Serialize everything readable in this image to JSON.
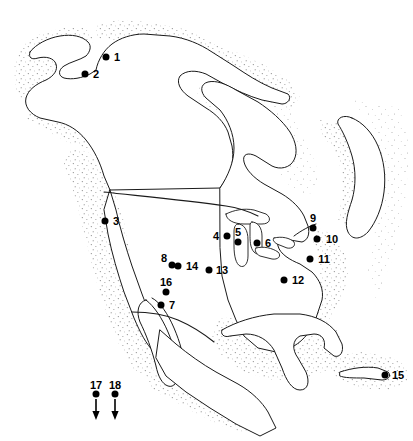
{
  "figure": {
    "kind": "locator-map",
    "region": "North America",
    "background_color": "#ffffff",
    "ink_color": "#000000",
    "coastline_shading": "stipple"
  },
  "markers": [
    {
      "id": "1",
      "label": "1",
      "x": 106,
      "y": 57,
      "label_x": 117,
      "label_y": 57
    },
    {
      "id": "2",
      "label": "2",
      "x": 85,
      "y": 74,
      "label_x": 96,
      "label_y": 74
    },
    {
      "id": "3",
      "label": "3",
      "x": 105,
      "y": 221,
      "label_x": 116,
      "label_y": 221
    },
    {
      "id": "4",
      "label": "4",
      "x": 227,
      "y": 236,
      "label_x": 216,
      "label_y": 236
    },
    {
      "id": "5",
      "label": "5",
      "x": 238,
      "y": 242,
      "label_x": 238,
      "label_y": 232
    },
    {
      "id": "6",
      "label": "6",
      "x": 257,
      "y": 243,
      "label_x": 268,
      "label_y": 243
    },
    {
      "id": "7",
      "label": "7",
      "x": 161,
      "y": 305,
      "label_x": 172,
      "label_y": 305
    },
    {
      "id": "8",
      "label": "8",
      "x": 172,
      "y": 265,
      "label_x": 164,
      "label_y": 258
    },
    {
      "id": "9",
      "label": "9",
      "x": 313,
      "y": 228,
      "label_x": 313,
      "label_y": 218
    },
    {
      "id": "10",
      "label": "10",
      "x": 317,
      "y": 239,
      "label_x": 332,
      "label_y": 239
    },
    {
      "id": "11",
      "label": "11",
      "x": 310,
      "y": 259,
      "label_x": 324,
      "label_y": 259
    },
    {
      "id": "12",
      "label": "12",
      "x": 284,
      "y": 280,
      "label_x": 298,
      "label_y": 280
    },
    {
      "id": "13",
      "label": "13",
      "x": 209,
      "y": 270,
      "label_x": 222,
      "label_y": 270
    },
    {
      "id": "14",
      "label": "14",
      "x": 178,
      "y": 266,
      "label_x": 192,
      "label_y": 266
    },
    {
      "id": "15",
      "label": "15",
      "x": 385,
      "y": 375,
      "label_x": 398,
      "label_y": 375
    },
    {
      "id": "16",
      "label": "16",
      "x": 166,
      "y": 292,
      "label_x": 166,
      "label_y": 282
    },
    {
      "id": "17",
      "label": "17",
      "x": 96,
      "y": 394,
      "label_x": 96,
      "label_y": 385
    },
    {
      "id": "18",
      "label": "18",
      "x": 115,
      "y": 394,
      "label_x": 115,
      "label_y": 385
    }
  ],
  "arrows": [
    {
      "id": "arrow-17",
      "for_marker": "17",
      "x": 96,
      "y_start": 399,
      "y_end": 419,
      "direction": "down"
    },
    {
      "id": "arrow-18",
      "for_marker": "18",
      "x": 115,
      "y_start": 399,
      "y_end": 419,
      "direction": "down"
    }
  ]
}
